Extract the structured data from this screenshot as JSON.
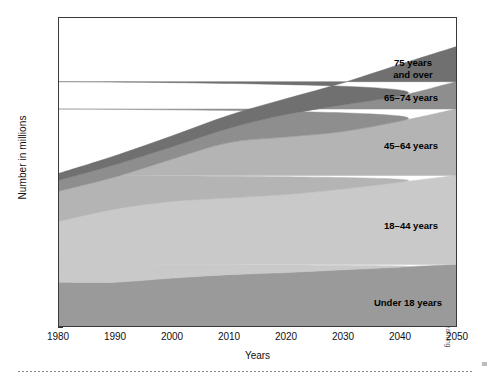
{
  "figure": {
    "ylabel": "Number in millions",
    "xlabel": "Years",
    "credit": "© Cengage Learning"
  },
  "chart_data": {
    "type": "area",
    "title": "",
    "xlabel": "Years",
    "ylabel": "Number in millions",
    "xlim": [
      1980,
      2050
    ],
    "ylim": [
      0,
      450
    ],
    "xticks": [
      1980,
      1990,
      2000,
      2010,
      2020,
      2030,
      2040,
      2050
    ],
    "yticks": [
      0,
      50,
      100,
      150,
      200,
      250,
      300,
      350,
      400,
      450
    ],
    "grid": false,
    "legend_position": "inline-labels",
    "stacked": true,
    "x": [
      1980,
      1990,
      2000,
      2010,
      2020,
      2030,
      2040,
      2050
    ],
    "series": [
      {
        "name": "Under 18 years",
        "color": "#9a9a9a",
        "values": [
          64,
          64,
          70,
          75,
          78,
          82,
          86,
          90
        ]
      },
      {
        "name": "18–44 years",
        "color": "#c9c9c9",
        "values": [
          89,
          107,
          112,
          112,
          114,
          118,
          124,
          130
        ]
      },
      {
        "name": "45–64 years",
        "color": "#b4b4b4",
        "values": [
          44,
          47,
          62,
          81,
          84,
          84,
          89,
          97
        ]
      },
      {
        "name": "65–74 years",
        "color": "#8e8e8e",
        "values": [
          16,
          18,
          18,
          21,
          33,
          39,
          37,
          40
        ]
      },
      {
        "name": "75 years and over",
        "color": "#707070",
        "values": [
          10,
          13,
          16,
          19,
          23,
          32,
          46,
          51
        ]
      }
    ],
    "totals": [
      223,
      249,
      278,
      308,
      332,
      355,
      382,
      408
    ],
    "annotations": [
      {
        "text": "75 years and over",
        "series": "75 years and over"
      },
      {
        "text": "65–74 years",
        "series": "65–74 years"
      },
      {
        "text": "45–64 years",
        "series": "45–64 years"
      },
      {
        "text": "18–44 years",
        "series": "18–44 years"
      },
      {
        "text": "Under 18 years",
        "series": "Under 18 years"
      }
    ]
  },
  "labels": {
    "under18": "Under 18 years",
    "a18_44": "18–44 years",
    "a45_64": "45–64 years",
    "a65_74": "65–74 years",
    "a75plus": "75 years\nand over"
  }
}
